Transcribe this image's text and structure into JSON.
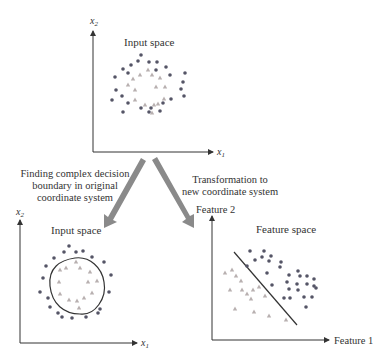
{
  "colors": {
    "axis": "#333333",
    "dot": "#555566",
    "triangle": "#b8b0b0",
    "arrow": "#8a8a8a",
    "boundary": "#333333"
  },
  "top_panel": {
    "title": "Input space",
    "x_axis_label": "x",
    "x_axis_sub": "1",
    "y_axis_label": "x",
    "y_axis_sub": "2"
  },
  "left_caption": {
    "lines": [
      "Finding complex decision",
      "boundary in original",
      "coordinate system"
    ]
  },
  "right_caption": {
    "lines": [
      "Transformation to",
      "new coordinate system"
    ]
  },
  "bottom_left_panel": {
    "title": "Input space",
    "x_axis_label": "x",
    "x_axis_sub": "1",
    "y_axis_label": "x",
    "y_axis_sub": "2"
  },
  "bottom_right_panel": {
    "title": "Feature space",
    "x_axis_label": "Feature 1",
    "y_axis_label": "Feature 2"
  },
  "legend_semantics": {
    "dots": "class A (outer ring / upper-right cluster)",
    "triangles": "class B (inner ring / lower-left cluster)"
  },
  "top_dots": [
    [
      141,
      55
    ],
    [
      138,
      61
    ],
    [
      149,
      62
    ],
    [
      157,
      62
    ],
    [
      131,
      65
    ],
    [
      166,
      67
    ],
    [
      123,
      69
    ],
    [
      156,
      70
    ],
    [
      128,
      73
    ],
    [
      185,
      73
    ],
    [
      170,
      75
    ],
    [
      115,
      77
    ],
    [
      183,
      82
    ],
    [
      181,
      89
    ],
    [
      116,
      90
    ],
    [
      122,
      96
    ],
    [
      184,
      96
    ],
    [
      171,
      99
    ],
    [
      112,
      100
    ],
    [
      128,
      103
    ],
    [
      163,
      103
    ],
    [
      141,
      108
    ],
    [
      151,
      108
    ],
    [
      149,
      112
    ],
    [
      160,
      111
    ],
    [
      123,
      112
    ]
  ],
  "top_triangles": [
    [
      148,
      70
    ],
    [
      140,
      75
    ],
    [
      152,
      75
    ],
    [
      133,
      79
    ],
    [
      160,
      78
    ],
    [
      128,
      85
    ],
    [
      156,
      87
    ],
    [
      165,
      87
    ],
    [
      135,
      90
    ],
    [
      164,
      99
    ],
    [
      135,
      100
    ],
    [
      145,
      105
    ],
    [
      154,
      105
    ],
    [
      158,
      104
    ],
    [
      152,
      113
    ]
  ],
  "bl_dots": [
    [
      69,
      246
    ],
    [
      64,
      252
    ],
    [
      76,
      252
    ],
    [
      83,
      251
    ],
    [
      54,
      258
    ],
    [
      92,
      257
    ],
    [
      46,
      266
    ],
    [
      104,
      262
    ],
    [
      43,
      278
    ],
    [
      111,
      275
    ],
    [
      40,
      292
    ],
    [
      109,
      292
    ],
    [
      48,
      298
    ],
    [
      50,
      307
    ],
    [
      100,
      309
    ],
    [
      58,
      313
    ],
    [
      98,
      313
    ],
    [
      62,
      317
    ],
    [
      72,
      318
    ],
    [
      86,
      317
    ]
  ],
  "bl_triangles": [
    [
      76,
      262
    ],
    [
      60,
      270
    ],
    [
      66,
      268
    ],
    [
      80,
      268
    ],
    [
      90,
      272
    ],
    [
      59,
      282
    ],
    [
      88,
      282
    ],
    [
      97,
      281
    ],
    [
      60,
      294
    ],
    [
      92,
      293
    ],
    [
      69,
      300
    ],
    [
      77,
      301
    ],
    [
      84,
      298
    ],
    [
      79,
      308
    ]
  ],
  "bl_boundary": "M 75 258 C 90 256, 102 268, 104 282 C 107 298, 95 316, 80 314 C 64 314, 52 304, 50 286 C 48 268, 60 260, 75 258 Z",
  "br_dots": [
    [
      250,
      251
    ],
    [
      264,
      251
    ],
    [
      262,
      257
    ],
    [
      271,
      256
    ],
    [
      255,
      260
    ],
    [
      269,
      261
    ],
    [
      281,
      262
    ],
    [
      280,
      267
    ],
    [
      247,
      266
    ],
    [
      289,
      275
    ],
    [
      298,
      271
    ],
    [
      267,
      273
    ],
    [
      300,
      276
    ],
    [
      307,
      276
    ],
    [
      314,
      279
    ],
    [
      287,
      282
    ],
    [
      297,
      284
    ],
    [
      307,
      284
    ],
    [
      314,
      286
    ],
    [
      272,
      285
    ],
    [
      289,
      289
    ],
    [
      298,
      290
    ],
    [
      316,
      288
    ],
    [
      284,
      298
    ],
    [
      290,
      298
    ],
    [
      304,
      297
    ],
    [
      312,
      297
    ],
    [
      306,
      307
    ]
  ],
  "br_triangles": [
    [
      225,
      273
    ],
    [
      232,
      270
    ],
    [
      236,
      276
    ],
    [
      241,
      281
    ],
    [
      230,
      290
    ],
    [
      242,
      290
    ],
    [
      247,
      294
    ],
    [
      253,
      290
    ],
    [
      259,
      287
    ],
    [
      251,
      299
    ],
    [
      265,
      296
    ],
    [
      235,
      309
    ],
    [
      254,
      312
    ],
    [
      269,
      316
    ],
    [
      286,
      320
    ]
  ],
  "br_boundary": [
    234,
    252,
    297,
    325
  ]
}
